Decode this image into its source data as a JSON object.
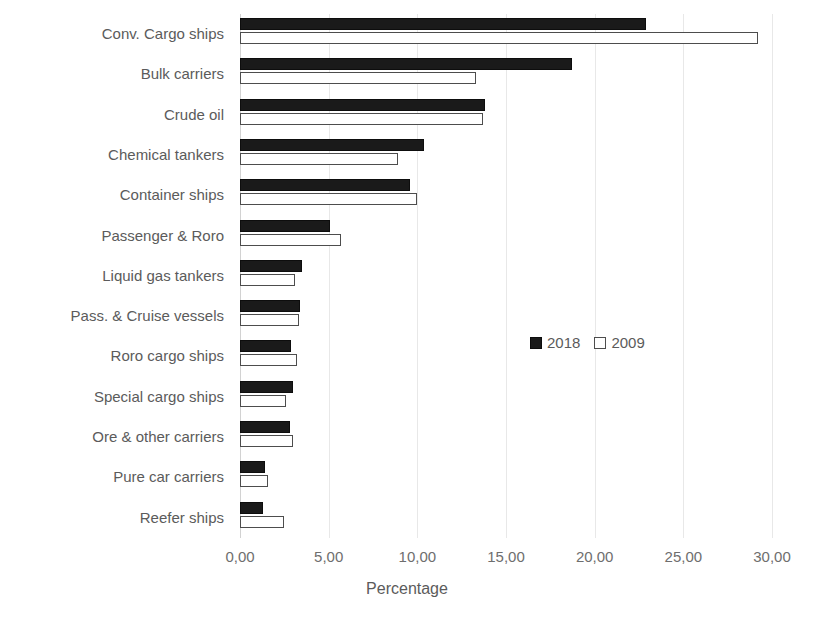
{
  "chart_data": {
    "type": "bar",
    "orientation": "horizontal",
    "title": "",
    "xlabel": "Percentage",
    "ylabel": "",
    "xlim": [
      0,
      30
    ],
    "xticks": [
      "0,00",
      "5,00",
      "10,00",
      "15,00",
      "20,00",
      "25,00",
      "30,00"
    ],
    "xtick_values": [
      0,
      5,
      10,
      15,
      20,
      25,
      30
    ],
    "grid": "vertical",
    "legend_position": "inside-right",
    "categories": [
      "Conv. Cargo ships",
      "Bulk carriers",
      "Crude oil",
      "Chemical tankers",
      "Container ships",
      "Passenger & Roro",
      "Liquid gas tankers",
      "Pass. & Cruise vessels",
      "Roro cargo ships",
      "Special cargo ships",
      "Ore & other carriers",
      "Pure car carriers",
      "Reefer ships"
    ],
    "series": [
      {
        "name": "2018",
        "color": "#1a1a1a",
        "values": [
          22.9,
          18.7,
          13.8,
          10.4,
          9.6,
          5.1,
          3.5,
          3.4,
          2.9,
          3.0,
          2.8,
          1.4,
          1.3
        ]
      },
      {
        "name": "2009",
        "color": "#ffffff",
        "values": [
          29.2,
          13.3,
          13.7,
          8.9,
          10.0,
          5.7,
          3.1,
          3.3,
          3.2,
          2.6,
          3.0,
          1.6,
          2.5
        ]
      }
    ]
  },
  "legend": {
    "items": [
      {
        "label": "2018",
        "swatch": "filled-square-icon"
      },
      {
        "label": "2009",
        "swatch": "hollow-square-icon"
      }
    ]
  }
}
